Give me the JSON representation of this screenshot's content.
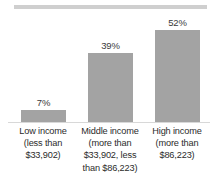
{
  "chart_data": {
    "type": "bar",
    "title": "",
    "subtitle": "",
    "xlabel": "",
    "ylabel": "",
    "ylim": [
      0,
      62
    ],
    "grid": false,
    "legend": "none",
    "categories": [
      "Low income (less than $33,902)",
      "Middle income (more than $33,902, less than $86,223)",
      "High income (more than $86,223)"
    ],
    "values": [
      7,
      39,
      52
    ],
    "value_labels": [
      "7%",
      "39%",
      "52%"
    ],
    "bar_color": "#a3a3a3",
    "label_color": "#2b2b2b",
    "rule_color": "#cfcfcf",
    "category_lines": [
      [
        "Low income",
        "(less than",
        "$33,902)"
      ],
      [
        "Middle income",
        "(more than",
        "$33,902, less",
        "than $86,223)"
      ],
      [
        "High income",
        "(more than",
        "$86,223)"
      ]
    ]
  }
}
